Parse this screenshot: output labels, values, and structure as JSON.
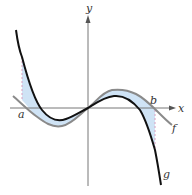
{
  "diagram": {
    "axes": {
      "x_label": "x",
      "y_label": "y"
    },
    "points": {
      "a_label": "a",
      "b_label": "b"
    },
    "curves": [
      {
        "name": "f",
        "label": "f",
        "color": "#8a8a8a"
      },
      {
        "name": "g",
        "label": "g",
        "color": "#111111"
      }
    ],
    "shading_color": "#cfe3f5",
    "dashed_line_color": "#d9a0c0"
  }
}
